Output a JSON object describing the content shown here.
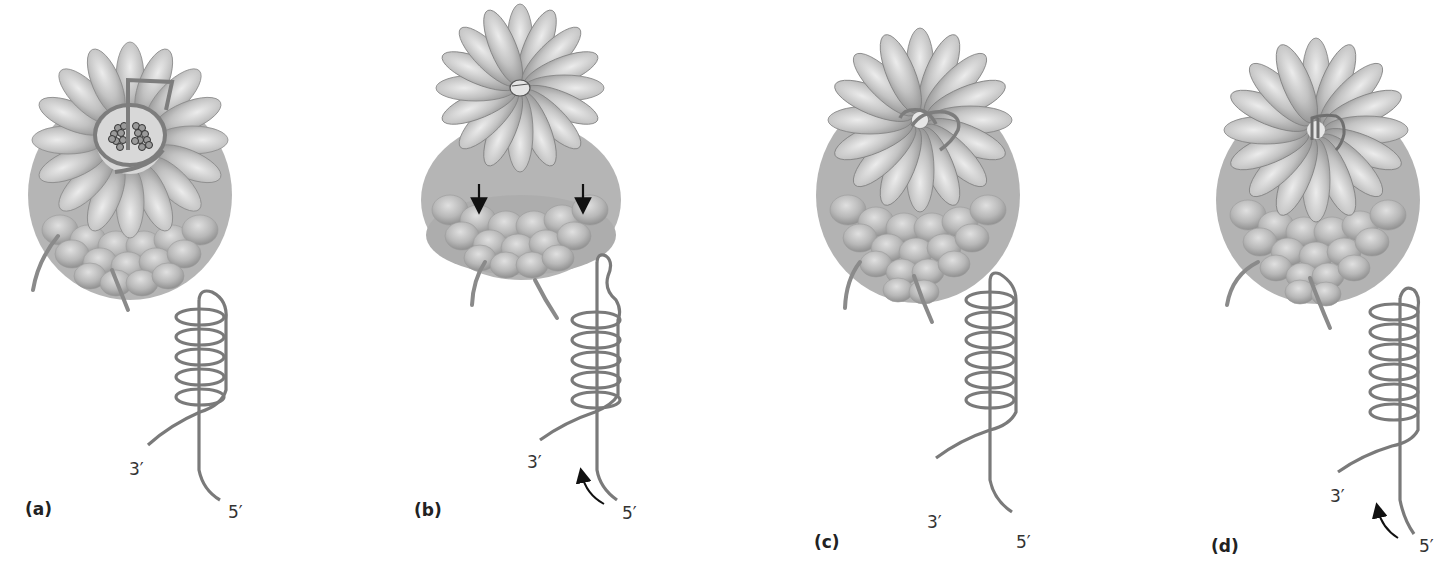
{
  "figure": {
    "colors": {
      "background": "#ffffff",
      "subunit_fill": "#bdbdbd",
      "subunit_highlight": "#e2e2e2",
      "subunit_shadow": "#8c8c8c",
      "strand": "#7d7d7d",
      "arrow": "#111111",
      "text": "#222222"
    },
    "panels": [
      {
        "id": "a",
        "label": "(a)",
        "three_prime": "3′",
        "five_prime": "5′",
        "has_motion_arrow": false,
        "has_down_arrows": false,
        "cap_state": "strand looped over open ring with exposed core particles",
        "helix_turns": 5
      },
      {
        "id": "b",
        "label": "(b)",
        "three_prime": "3′",
        "five_prime": "5′",
        "has_motion_arrow": true,
        "has_down_arrows": true,
        "cap_state": "cap ring lifted above barrel, strand threaded in center",
        "helix_turns": 5
      },
      {
        "id": "c",
        "label": "(c)",
        "three_prime": "3′",
        "five_prime": "5′",
        "has_motion_arrow": false,
        "has_down_arrows": false,
        "cap_state": "cap seated, strand loop crossing center",
        "helix_turns": 6
      },
      {
        "id": "d",
        "label": "(d)",
        "three_prime": "3′",
        "five_prime": "5′",
        "has_motion_arrow": true,
        "has_down_arrows": false,
        "cap_state": "cap seated, strand drawn into center pore",
        "helix_turns": 6
      }
    ]
  }
}
